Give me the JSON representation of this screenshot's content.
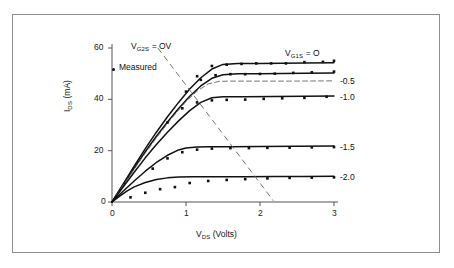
{
  "figure": {
    "background": "#ffffff",
    "frame_color": "#8e8e8e",
    "ink_color": "#111111",
    "dash_color": "#666666"
  },
  "axes": {
    "x_title_prefix": "V",
    "x_title_sub": "DS",
    "x_title_suffix": " (Volts)",
    "x_title_full": "VDS (Volts)",
    "y_title_prefix": "I",
    "y_title_sub": "DS",
    "y_title_suffix": " (mA)",
    "y_title_full": "IDS (mA)",
    "x_ticks": [
      "0",
      "1",
      "2",
      "3"
    ],
    "y_ticks": [
      "0",
      "20",
      "40",
      "60"
    ],
    "x_origin_label": "0"
  },
  "legend": {
    "measured_marker": "dot-marker",
    "measured_label": "Measured"
  },
  "annotations": {
    "left_prefix": "V",
    "left_sub": "G2S",
    "left_suffix": " = OV",
    "left_full": "VG2S = OV",
    "right_prefix": "V",
    "right_sub": "G1S",
    "right_suffix": " = O",
    "right_full": "VG1S = O"
  },
  "curve_labels": [
    {
      "text": "-0.5"
    },
    {
      "text": "-1.0"
    },
    {
      "text": "-1.5"
    },
    {
      "text": "-2.0"
    }
  ],
  "chart_data": {
    "type": "line",
    "title": "",
    "subtitle": "",
    "xlabel": "VDS (Volts)",
    "ylabel": "IDS (mA)",
    "xlim": [
      0,
      3
    ],
    "ylim": [
      0,
      60
    ],
    "xticks": [
      0,
      1,
      2,
      3
    ],
    "yticks": [
      0,
      20,
      40,
      60
    ],
    "grid": false,
    "legend_position": "inside-upper-left",
    "legend_entries": [
      "Measured"
    ],
    "annotations": [
      "VG2S = OV",
      "VG1S = O"
    ],
    "series": [
      {
        "name": "VG1S = O",
        "style": "solid",
        "saturation_ma": 54,
        "knee_v": 1.5,
        "x": [
          0,
          0.15,
          0.3,
          0.45,
          0.6,
          0.75,
          0.9,
          1.05,
          1.2,
          1.35,
          1.5,
          1.7,
          2.0,
          2.3,
          2.6,
          3.0
        ],
        "y": [
          0,
          7.0,
          14.0,
          20.8,
          27.2,
          33.2,
          38.8,
          44.0,
          48.4,
          51.8,
          53.6,
          54.0,
          54.0,
          54.1,
          54.2,
          54.3
        ]
      },
      {
        "name": "-0.5",
        "style": "solid",
        "saturation_ma": 50,
        "knee_v": 1.35,
        "x": [
          0,
          0.15,
          0.3,
          0.45,
          0.6,
          0.75,
          0.9,
          1.05,
          1.2,
          1.35,
          1.5,
          1.7,
          2.0,
          2.3,
          2.6,
          3.0
        ],
        "y": [
          0,
          6.6,
          13.2,
          19.6,
          25.6,
          31.2,
          36.4,
          41.2,
          45.2,
          48.2,
          49.6,
          50.0,
          50.0,
          50.1,
          50.2,
          50.3
        ]
      },
      {
        "name": "-0.5-dashed",
        "style": "dashed",
        "saturation_ma": 47,
        "knee_v": 1.3,
        "x": [
          0,
          0.2,
          0.4,
          0.6,
          0.8,
          1.0,
          1.15,
          1.3,
          1.45,
          1.6,
          2.0,
          2.4,
          3.0
        ],
        "y": [
          0,
          8.6,
          17.0,
          25.0,
          32.4,
          39.2,
          43.2,
          46.0,
          47.0,
          47.1,
          47.1,
          47.1,
          47.2
        ]
      },
      {
        "name": "-1.0",
        "style": "solid",
        "saturation_ma": 41,
        "knee_v": 1.25,
        "x": [
          0,
          0.15,
          0.3,
          0.45,
          0.6,
          0.75,
          0.9,
          1.05,
          1.2,
          1.35,
          1.5,
          1.8,
          2.2,
          2.6,
          3.0
        ],
        "y": [
          0,
          5.8,
          11.6,
          17.2,
          22.4,
          27.2,
          31.6,
          35.6,
          38.8,
          40.6,
          41.0,
          41.0,
          41.1,
          41.2,
          41.3
        ]
      },
      {
        "name": "-1.5",
        "style": "solid",
        "saturation_ma": 21.5,
        "knee_v": 1.0,
        "x": [
          0,
          0.15,
          0.3,
          0.45,
          0.6,
          0.75,
          0.9,
          1.0,
          1.15,
          1.3,
          1.6,
          2.0,
          2.5,
          3.0
        ],
        "y": [
          0,
          4.2,
          8.2,
          12.0,
          15.4,
          18.2,
          20.3,
          21.0,
          21.4,
          21.5,
          21.5,
          21.6,
          21.7,
          21.8
        ]
      },
      {
        "name": "-2.0",
        "style": "solid",
        "saturation_ma": 9.8,
        "knee_v": 0.8,
        "x": [
          0,
          0.1,
          0.2,
          0.3,
          0.45,
          0.6,
          0.75,
          0.9,
          1.1,
          1.4,
          1.8,
          2.2,
          2.6,
          3.0
        ],
        "y": [
          0,
          2.2,
          4.2,
          5.9,
          7.6,
          8.8,
          9.4,
          9.7,
          9.8,
          9.8,
          9.8,
          9.9,
          9.9,
          10.0
        ]
      }
    ],
    "measured_points": [
      {
        "series": "VG1S = O",
        "x": [
          1.15,
          1.35,
          1.55,
          1.75,
          1.95,
          2.15,
          2.35,
          2.6,
          2.85,
          3.0
        ],
        "y": [
          49.0,
          53.0,
          53.5,
          53.8,
          54.0,
          54.0,
          54.0,
          54.5,
          54.6,
          55.0
        ]
      },
      {
        "series": "-0.5",
        "x": [
          1.0,
          1.2,
          1.4,
          1.6,
          1.8,
          2.0,
          2.2,
          2.45,
          2.7,
          3.0
        ],
        "y": [
          43.0,
          47.6,
          49.4,
          49.8,
          49.8,
          49.9,
          50.0,
          50.3,
          50.5,
          50.8
        ]
      },
      {
        "series": "-1.0",
        "x": [
          0.75,
          0.95,
          1.15,
          1.35,
          1.55,
          1.8,
          2.05,
          2.3,
          2.6,
          2.9
        ],
        "y": [
          31.0,
          36.5,
          38.8,
          39.6,
          39.8,
          39.9,
          40.2,
          40.4,
          40.6,
          41.0
        ]
      },
      {
        "series": "-1.5",
        "x": [
          0.55,
          0.75,
          0.95,
          1.15,
          1.35,
          1.6,
          1.85,
          2.1,
          2.4,
          2.7,
          3.0
        ],
        "y": [
          13.0,
          17.0,
          19.4,
          20.4,
          20.8,
          21.0,
          21.0,
          21.1,
          21.2,
          21.3,
          21.4
        ]
      },
      {
        "series": "-2.0",
        "x": [
          0.25,
          0.45,
          0.65,
          0.85,
          1.05,
          1.3,
          1.55,
          1.8,
          2.1,
          2.4,
          2.7,
          3.0
        ],
        "y": [
          1.8,
          3.6,
          5.0,
          5.8,
          7.4,
          8.2,
          8.6,
          8.9,
          9.2,
          9.4,
          9.5,
          9.6
        ]
      }
    ],
    "locus_line": {
      "name": "pinch-off-locus",
      "style": "dashed",
      "x": [
        0.62,
        2.18
      ],
      "y": [
        60.0,
        0.5
      ]
    }
  }
}
